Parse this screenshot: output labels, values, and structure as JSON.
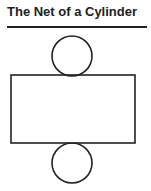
{
  "title": "The Net of a Cylinder",
  "diagram": {
    "stroke_color": "#222222",
    "top_circle": {
      "cx": 72,
      "cy": 56,
      "r": 20
    },
    "rectangle": {
      "x": 11,
      "y": 75,
      "width": 124,
      "height": 68
    },
    "bottom_circle": {
      "cx": 72,
      "cy": 163,
      "r": 20
    }
  }
}
